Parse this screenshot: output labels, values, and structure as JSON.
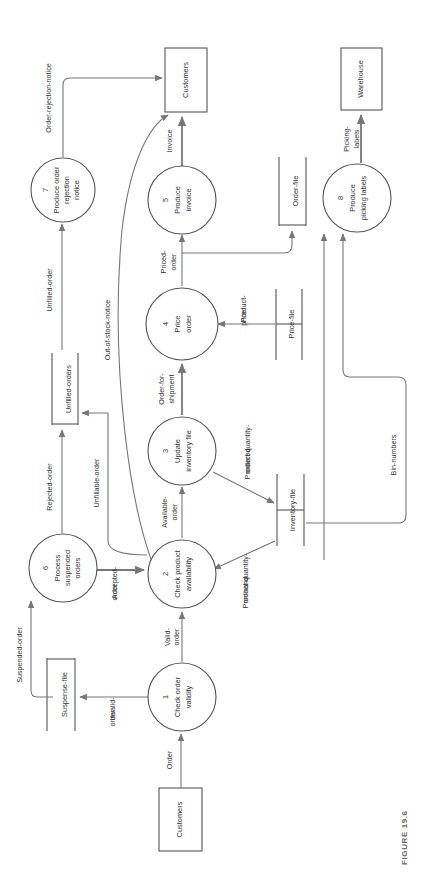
{
  "figure": {
    "caption": "FIGURE 19.6",
    "orientation": "rotated-90",
    "rotation_degrees": -90,
    "diagram_type": "data-flow-diagram"
  },
  "external_entities": [
    {
      "id": "cust-top",
      "label": "Customers"
    },
    {
      "id": "warehouse",
      "label": "Warehouse"
    },
    {
      "id": "cust-bottom",
      "label": "Customers"
    }
  ],
  "processes": [
    {
      "id": "p1",
      "number": "1",
      "line1": "Check order",
      "line2": "validity",
      "name": "Check order validity"
    },
    {
      "id": "p2",
      "number": "2",
      "line1": "Check product",
      "line2": "availability",
      "name": "Check product availability"
    },
    {
      "id": "p3",
      "number": "3",
      "line1": "Update",
      "line2": "inventory file",
      "name": "Update inventory file"
    },
    {
      "id": "p4",
      "number": "4",
      "line1": "Price",
      "line2": "order",
      "name": "Price order"
    },
    {
      "id": "p5",
      "number": "5",
      "line1": "Produce",
      "line2": "invoice",
      "name": "Produce invoice"
    },
    {
      "id": "p6",
      "number": "6",
      "line1": "Process",
      "line2": "suspended",
      "line3": "orders",
      "name": "Process suspended orders"
    },
    {
      "id": "p7",
      "number": "7",
      "line1": "Produce order",
      "line2": "rejection",
      "line3": "notice",
      "name": "Produce order rejection notice"
    },
    {
      "id": "p8",
      "number": "8",
      "line1": "Produce",
      "line2": "picking labels",
      "name": "Produce picking labels"
    }
  ],
  "data_stores": [
    {
      "id": "suspense-file",
      "label": "Suspense-file"
    },
    {
      "id": "unfilled-orders",
      "label": "Unfilled-orders"
    },
    {
      "id": "inventory-file",
      "label": "Inventory-file"
    },
    {
      "id": "price-file",
      "label": "Price-file"
    },
    {
      "id": "order-file",
      "label": "Order-file"
    }
  ],
  "data_flows": [
    {
      "id": "f-order",
      "label": "Order",
      "from": "cust-bottom",
      "to": "p1"
    },
    {
      "id": "f-invalid",
      "label1": "Invalid-",
      "label2": "order",
      "label": "Invalid-order",
      "from": "p1",
      "to": "suspense-file"
    },
    {
      "id": "f-valid",
      "label1": "Valid-",
      "label2": "order",
      "label": "Valid-order",
      "from": "p1",
      "to": "p2"
    },
    {
      "id": "f-suspended",
      "label": "Suspended-order",
      "from": "suspense-file",
      "to": "p6"
    },
    {
      "id": "f-accepted",
      "label1": "Accepted-",
      "label2": "order",
      "label": "Accepted-order",
      "from": "p6",
      "to": "p2"
    },
    {
      "id": "f-rejected",
      "label": "Rejected-order",
      "from": "p6",
      "to": "unfilled-orders"
    },
    {
      "id": "f-unfillable",
      "label": "Unfillable-order",
      "from": "p2",
      "to": "unfilled-orders"
    },
    {
      "id": "f-unfilled",
      "label": "Unfilled-order",
      "from": "unfilled-orders",
      "to": "p7"
    },
    {
      "id": "f-rejnotice",
      "label": "Order-rejection-notice",
      "from": "p7",
      "to": "cust-top"
    },
    {
      "id": "f-outofstock",
      "label": "Out-of-stock-notice",
      "from": "p2",
      "to": "cust-top"
    },
    {
      "id": "f-available",
      "label1": "Available-",
      "label2": "order",
      "label": "Available-order",
      "from": "p2",
      "to": "p3"
    },
    {
      "id": "f-pqoh",
      "label1": "Product-quantity-",
      "label2": "on-hand",
      "label": "Product-quantity-on-hand",
      "from": "inventory-file",
      "to": "p2"
    },
    {
      "id": "f-pqord",
      "label1": "Product-quantity-",
      "label2": "ordered",
      "label": "Product-quantity-ordered",
      "from": "p3",
      "to": "inventory-file"
    },
    {
      "id": "f-ofs",
      "label1": "Order-for-",
      "label2": "shipment",
      "label": "Order-for-shipment",
      "from": "p3",
      "to": "p4"
    },
    {
      "id": "f-pprice",
      "label1": "Product-",
      "label2": "price",
      "label": "Product-price",
      "from": "price-file",
      "to": "p4"
    },
    {
      "id": "f-priced",
      "label1": "Priced-",
      "label2": "order",
      "label": "Priced-order",
      "from": "p4",
      "to": "p5"
    },
    {
      "id": "f-orderfile",
      "label": "Order-file-write",
      "from": "p4",
      "to": "order-file"
    },
    {
      "id": "f-invoice",
      "label": "Invoice",
      "from": "p5",
      "to": "cust-top"
    },
    {
      "id": "f-binnumbers",
      "label": "Bin-numbers",
      "from": "inventory-file",
      "to": "p8"
    },
    {
      "id": "f-picking",
      "label1": "Picking-",
      "label2": "labels",
      "label": "Picking-labels",
      "from": "p8",
      "to": "warehouse"
    }
  ],
  "colors": {
    "stroke": "#555555",
    "flow": "#777777",
    "text": "#333333",
    "caption": "#6b6b6b",
    "background": "#ffffff"
  }
}
